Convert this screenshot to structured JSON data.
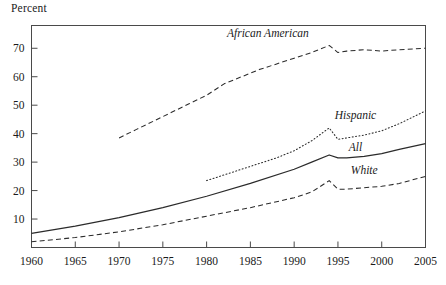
{
  "chart_data": {
    "type": "line",
    "title": "",
    "ylabel": "Percent",
    "xlabel": "",
    "xlim": [
      1960,
      2005
    ],
    "ylim": [
      0,
      78
    ],
    "grid": false,
    "legend_position": "inline-labels",
    "xticks": [
      1960,
      1965,
      1970,
      1975,
      1980,
      1985,
      1990,
      1995,
      2000,
      2005
    ],
    "yticks": [
      10,
      20,
      30,
      40,
      50,
      60,
      70
    ],
    "series": [
      {
        "name": "African American",
        "style": "dashed",
        "label_x": 1987,
        "label_y": 74,
        "x": [
          1970,
          1972,
          1974,
          1976,
          1978,
          1980,
          1982,
          1984,
          1986,
          1988,
          1990,
          1992,
          1994,
          1995,
          1996,
          1998,
          2000,
          2002,
          2005
        ],
        "values": [
          38.5,
          41.5,
          44.5,
          47.5,
          50.5,
          53.5,
          57.5,
          60.0,
          62.5,
          64.5,
          66.5,
          68.5,
          71.0,
          68.5,
          69.0,
          69.5,
          69.0,
          69.5,
          70.0
        ]
      },
      {
        "name": "Hispanic",
        "style": "dotted",
        "label_x": 1997,
        "label_y": 45,
        "x": [
          1980,
          1982,
          1984,
          1986,
          1988,
          1990,
          1992,
          1994,
          1995,
          1996,
          1998,
          2000,
          2002,
          2005
        ],
        "values": [
          23.5,
          25.5,
          27.5,
          29.5,
          31.5,
          34.0,
          37.5,
          42.0,
          38.0,
          38.5,
          39.5,
          41.0,
          43.5,
          48.0
        ]
      },
      {
        "name": "All",
        "style": "solid",
        "label_x": 1997,
        "label_y": 34,
        "x": [
          1960,
          1965,
          1970,
          1975,
          1980,
          1985,
          1990,
          1992,
          1994,
          1995,
          1996,
          1998,
          2000,
          2002,
          2005
        ],
        "values": [
          5.0,
          7.5,
          10.5,
          14.0,
          18.0,
          22.5,
          27.5,
          30.0,
          32.5,
          31.5,
          31.5,
          32.0,
          33.0,
          34.5,
          36.5
        ]
      },
      {
        "name": "White",
        "style": "dashed",
        "label_x": 1998,
        "label_y": 26,
        "x": [
          1960,
          1965,
          1970,
          1975,
          1980,
          1985,
          1990,
          1992,
          1994,
          1995,
          1996,
          1998,
          2000,
          2002,
          2005
        ],
        "values": [
          2.0,
          3.5,
          5.5,
          8.0,
          11.0,
          14.0,
          17.5,
          19.5,
          23.5,
          20.5,
          20.5,
          21.0,
          21.5,
          22.5,
          25.0
        ]
      }
    ]
  }
}
